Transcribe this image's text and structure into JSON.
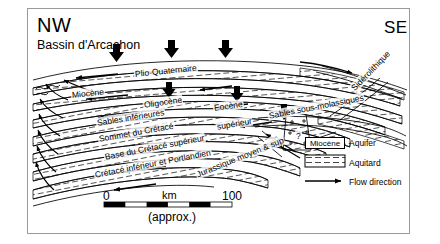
{
  "figure": {
    "type": "geological-cross-section",
    "orientation_left": "NW",
    "orientation_right": "SE",
    "location_label": "Bassin d'Arcachon"
  },
  "units": [
    {
      "id": "plio",
      "label": "Plio-Quaternaire",
      "x": 134,
      "y": 69,
      "rot": -6
    },
    {
      "id": "miocene",
      "label": "Miocène",
      "x": 71,
      "y": 90,
      "rot": -6
    },
    {
      "id": "oligocene",
      "label": "Oligocène",
      "x": 143,
      "y": 100,
      "rot": -8
    },
    {
      "id": "eocene",
      "label": "Eocène",
      "x": 213,
      "y": 103,
      "rot": -8
    },
    {
      "id": "sables_inf",
      "label": "Sables inférieures",
      "x": 96,
      "y": 118,
      "rot": -9
    },
    {
      "id": "sommet_cret",
      "label": "Sommet du Crétacé",
      "x": 98,
      "y": 134,
      "rot": -10
    },
    {
      "id": "base_cret_sup",
      "label": "Base du Crétacé supérieur",
      "x": 104,
      "y": 152,
      "rot": -11
    },
    {
      "id": "cret_inf_port",
      "label": "Crétacé inférieur et Portlandien",
      "x": 94,
      "y": 170,
      "rot": -11
    },
    {
      "id": "sables_sous_mol",
      "label": "Sables sous-molassiques",
      "x": 268,
      "y": 111,
      "rot": -11
    },
    {
      "id": "siderolithique",
      "label": "Sidérolithique",
      "x": 352,
      "y": 85,
      "rot": -46
    },
    {
      "id": "superieur",
      "label": "supérieur",
      "x": 216,
      "y": 122,
      "rot": -10
    },
    {
      "id": "b_sup",
      "label": "& sup",
      "x": 260,
      "y": 146,
      "rot": -38
    },
    {
      "id": "jurassique",
      "label": "Jurassique moyen & sup",
      "x": 196,
      "y": 170,
      "rot": -22
    },
    {
      "id": "fault_query",
      "label": "?",
      "x": 295,
      "y": 131,
      "rot": 0
    }
  ],
  "legend": {
    "aquifer_sample_label": "Miocène",
    "aquifer_label": "Aquifer",
    "aquitard_label": "Aquitard",
    "flow_label": "Flow direction"
  },
  "scale": {
    "start": "0",
    "mid_unit": "km",
    "end": "100",
    "note": "(approx.)"
  },
  "colors": {
    "line": "#000000",
    "frame": "#9a9a9a",
    "background": "#ffffff",
    "hatch": "#555555"
  }
}
